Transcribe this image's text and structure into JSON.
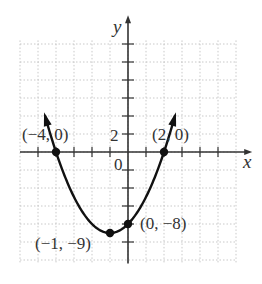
{
  "chart_data": {
    "type": "line",
    "title": "",
    "function": "y = x^2 + 2x - 8",
    "xlabel": "x",
    "ylabel": "y",
    "xlim": [
      -6,
      6
    ],
    "ylim": [
      -12,
      12
    ],
    "x_tick_step": 1,
    "y_tick_step": 2,
    "grid": true,
    "tick_labels": {
      "origin": "0",
      "y": "2"
    },
    "points": [
      {
        "x": -4,
        "y": 0,
        "label": "(−4, 0)"
      },
      {
        "x": 2,
        "y": 0,
        "label": "(2, 0)"
      },
      {
        "x": 0,
        "y": -8,
        "label": "(0, −8)"
      },
      {
        "x": -1,
        "y": -9,
        "label": "(−1, −9)"
      }
    ],
    "series": [
      {
        "name": "parabola",
        "x": [
          -4.6,
          -4,
          -3,
          -2,
          -1,
          0,
          1,
          2,
          2.6
        ],
        "y": [
          3.96,
          0,
          -5,
          -8,
          -9,
          -8,
          -5,
          0,
          3.96
        ]
      }
    ]
  },
  "labels": {
    "x_axis": "x",
    "y_axis": "y",
    "origin": "0",
    "y_tick_2": "2",
    "p1": "(−4, 0)",
    "p2": "(2, 0)",
    "p3": "(0, −8)",
    "p4": "(−1, −9)"
  }
}
